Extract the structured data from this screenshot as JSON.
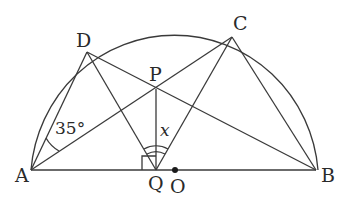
{
  "figure": {
    "type": "geometry-diagram",
    "points": {
      "A": {
        "label": "A",
        "x": 31,
        "y": 170
      },
      "B": {
        "label": "B",
        "x": 316,
        "y": 170
      },
      "C": {
        "label": "C",
        "x": 232,
        "y": 37
      },
      "D": {
        "label": "D",
        "x": 87,
        "y": 52
      },
      "P": {
        "label": "P",
        "x": 156,
        "y": 89
      },
      "Q": {
        "label": "Q",
        "x": 156,
        "y": 170
      },
      "O": {
        "label": "O",
        "x": 175,
        "y": 170
      }
    },
    "circle": {
      "center": "O",
      "radius": 144,
      "kind": "semicircle"
    },
    "segments": [
      "AB",
      "AD",
      "AC",
      "BD",
      "BC",
      "DQ",
      "CQ",
      "PQ"
    ],
    "angle_labels": {
      "DAC": "35°",
      "DQC": "x"
    },
    "right_angle_at": "Q",
    "center_dot": "O"
  }
}
